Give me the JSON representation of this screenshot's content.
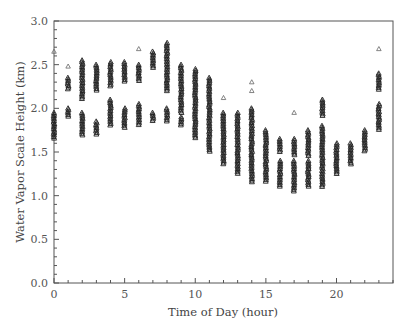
{
  "chart_data": {
    "type": "scatter",
    "title": "",
    "xlabel": "Time of Day (hour)",
    "ylabel": "Water Vapor Scale Height (km)",
    "xlim": [
      0,
      24
    ],
    "ylim": [
      0.0,
      3.0
    ],
    "x_ticks": [
      0,
      5,
      10,
      15,
      20
    ],
    "x_tick_labels": [
      "0",
      "5",
      "10",
      "15",
      "20"
    ],
    "y_ticks": [
      0.0,
      0.5,
      1.0,
      1.5,
      2.0,
      2.5,
      3.0
    ],
    "y_tick_labels": [
      "0.0",
      "0.5",
      "1.0",
      "1.5",
      "2.0",
      "2.5",
      "3.0"
    ],
    "grid": false,
    "legend": null,
    "marker": "open-triangle",
    "marker_color": "#222222",
    "series": [
      {
        "name": "scale_height_by_hour",
        "columns": [
          {
            "hour": 0,
            "ranges": [
              [
                1.65,
                1.95
              ]
            ],
            "outliers": [
              2.65
            ]
          },
          {
            "hour": 1,
            "ranges": [
              [
                2.22,
                2.35
              ],
              [
                1.9,
                2.0
              ]
            ],
            "outliers": [
              2.48
            ]
          },
          {
            "hour": 2,
            "ranges": [
              [
                2.1,
                2.55
              ],
              [
                1.68,
                1.95
              ]
            ],
            "outliers": []
          },
          {
            "hour": 3,
            "ranges": [
              [
                2.2,
                2.5
              ],
              [
                1.7,
                1.85
              ]
            ],
            "outliers": []
          },
          {
            "hour": 4,
            "ranges": [
              [
                2.25,
                2.53
              ],
              [
                1.8,
                2.1
              ]
            ],
            "outliers": []
          },
          {
            "hour": 5,
            "ranges": [
              [
                2.3,
                2.53
              ],
              [
                1.78,
                2.0
              ]
            ],
            "outliers": []
          },
          {
            "hour": 6,
            "ranges": [
              [
                2.3,
                2.5
              ],
              [
                1.8,
                2.05
              ]
            ],
            "outliers": [
              2.68
            ]
          },
          {
            "hour": 7,
            "ranges": [
              [
                2.45,
                2.65
              ],
              [
                1.85,
                1.95
              ]
            ],
            "outliers": []
          },
          {
            "hour": 8,
            "ranges": [
              [
                2.2,
                2.75
              ],
              [
                1.85,
                2.0
              ]
            ],
            "outliers": []
          },
          {
            "hour": 9,
            "ranges": [
              [
                1.95,
                2.5
              ],
              [
                1.8,
                1.9
              ]
            ],
            "outliers": []
          },
          {
            "hour": 10,
            "ranges": [
              [
                1.65,
                2.45
              ]
            ],
            "outliers": []
          },
          {
            "hour": 11,
            "ranges": [
              [
                1.5,
                2.35
              ]
            ],
            "outliers": []
          },
          {
            "hour": 12,
            "ranges": [
              [
                1.35,
                1.95
              ]
            ],
            "outliers": [
              2.12
            ]
          },
          {
            "hour": 13,
            "ranges": [
              [
                1.25,
                1.95
              ]
            ],
            "outliers": []
          },
          {
            "hour": 14,
            "ranges": [
              [
                1.15,
                2.0
              ]
            ],
            "outliers": [
              2.2,
              2.3
            ]
          },
          {
            "hour": 15,
            "ranges": [
              [
                1.15,
                1.75
              ]
            ],
            "outliers": []
          },
          {
            "hour": 16,
            "ranges": [
              [
                1.1,
                1.4
              ],
              [
                1.5,
                1.65
              ]
            ],
            "outliers": []
          },
          {
            "hour": 17,
            "ranges": [
              [
                1.05,
                1.4
              ],
              [
                1.45,
                1.65
              ]
            ],
            "outliers": [
              1.95
            ]
          },
          {
            "hour": 18,
            "ranges": [
              [
                1.1,
                1.4
              ],
              [
                1.45,
                1.75
              ]
            ],
            "outliers": []
          },
          {
            "hour": 19,
            "ranges": [
              [
                1.1,
                1.8
              ],
              [
                1.9,
                2.1
              ]
            ],
            "outliers": []
          },
          {
            "hour": 20,
            "ranges": [
              [
                1.25,
                1.6
              ]
            ],
            "outliers": []
          },
          {
            "hour": 21,
            "ranges": [
              [
                1.35,
                1.6
              ]
            ],
            "outliers": []
          },
          {
            "hour": 22,
            "ranges": [
              [
                1.5,
                1.75
              ]
            ],
            "outliers": []
          },
          {
            "hour": 23,
            "ranges": [
              [
                1.75,
                2.05
              ],
              [
                2.2,
                2.4
              ]
            ],
            "outliers": [
              2.68
            ]
          }
        ]
      }
    ]
  }
}
